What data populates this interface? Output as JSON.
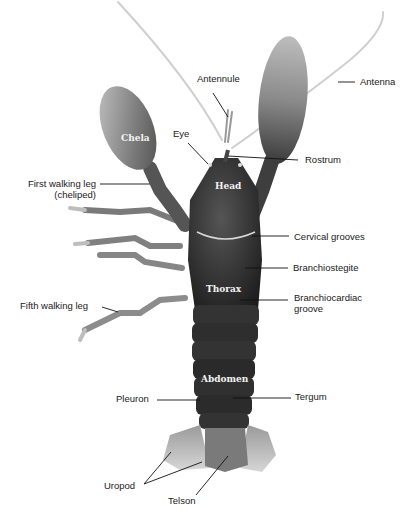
{
  "figure": {
    "colors": {
      "background": "#ffffff",
      "body": "#2b2b2b",
      "appendage": "#8a8a8a",
      "label": "#1a1a1a",
      "in_body_label": "#f2f2f2"
    }
  },
  "in_body_labels": {
    "chela": "Chela",
    "head": "Head",
    "thorax": "Thorax",
    "abdomen": "Abdomen"
  },
  "labels": {
    "antennule": "Antennule",
    "antenna": "Antenna",
    "eye": "Eye",
    "rostrum": "Rostrum",
    "first_walking_leg_1": "First walking leg",
    "first_walking_leg_2": "(cheliped)",
    "cervical_grooves": "Cervical grooves",
    "branchiostegite": "Branchiostegite",
    "branchiocardiac_1": "Branchiocardiac",
    "branchiocardiac_2": "groove",
    "fifth_walking_leg": "Fifth walking leg",
    "pleuron": "Pleuron",
    "tergum": "Tergum",
    "uropod": "Uropod",
    "telson": "Telson"
  }
}
